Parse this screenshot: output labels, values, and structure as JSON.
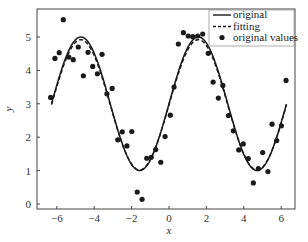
{
  "chart_data": {
    "type": "line",
    "title": "",
    "xlabel": "x",
    "ylabel": "y",
    "xlim": [
      -7.0,
      6.95
    ],
    "ylim": [
      -0.15,
      5.85
    ],
    "xticks": [
      -6,
      -4,
      -2,
      0,
      2,
      4,
      6
    ],
    "xtick_labels": [
      "−6",
      "−4",
      "−2",
      "0",
      "2",
      "4",
      "6"
    ],
    "yticks": [
      0,
      1,
      2,
      3,
      4,
      5
    ],
    "ytick_labels": [
      "0",
      "1",
      "2",
      "3",
      "4",
      "5"
    ],
    "grid": false,
    "legend_position": "upper right",
    "legend": [
      {
        "label": "original",
        "style": "solid-line"
      },
      {
        "label": "fitting",
        "style": "dashed-line"
      },
      {
        "label": "original values",
        "style": "dot-marker"
      }
    ],
    "series": [
      {
        "name": "original",
        "type": "line",
        "style": "solid",
        "color": "#1a1a1a",
        "function": "y = 3 + 2*sin(x)",
        "params": {
          "offset": 3.0,
          "amplitude": 2.0,
          "phase": 0.0
        },
        "x_range": [
          -6.28,
          6.28
        ]
      },
      {
        "name": "fitting",
        "type": "line",
        "style": "dashed",
        "color": "#1a1a1a",
        "function": "y = 2.97 + 1.95*sin(x)",
        "params": {
          "offset": 2.97,
          "amplitude": 1.95,
          "phase": 0.0
        },
        "x_range": [
          -6.28,
          6.28
        ]
      },
      {
        "name": "original values",
        "type": "scatter",
        "color": "#1a1a1a",
        "points": [
          [
            -6.33,
            3.19
          ],
          [
            -6.1,
            4.36
          ],
          [
            -5.87,
            4.53
          ],
          [
            -5.65,
            5.52
          ],
          [
            -5.36,
            4.4
          ],
          [
            -5.12,
            4.32
          ],
          [
            -4.85,
            4.7
          ],
          [
            -4.58,
            3.84
          ],
          [
            -4.33,
            4.54
          ],
          [
            -4.08,
            4.12
          ],
          [
            -3.83,
            3.9
          ],
          [
            -3.58,
            4.48
          ],
          [
            -3.32,
            3.3
          ],
          [
            -3.04,
            3.46
          ],
          [
            -2.74,
            1.92
          ],
          [
            -2.5,
            2.16
          ],
          [
            -2.25,
            1.74
          ],
          [
            -1.99,
            2.17
          ],
          [
            -1.7,
            0.36
          ],
          [
            -1.44,
            0.14
          ],
          [
            -1.19,
            1.37
          ],
          [
            -0.95,
            1.4
          ],
          [
            -0.71,
            1.63
          ],
          [
            -0.44,
            1.25
          ],
          [
            -0.21,
            2.02
          ],
          [
            0.07,
            2.66
          ],
          [
            0.27,
            3.5
          ],
          [
            0.5,
            4.79
          ],
          [
            0.77,
            5.13
          ],
          [
            1.03,
            5.03
          ],
          [
            1.27,
            5.01
          ],
          [
            1.53,
            5.03
          ],
          [
            1.8,
            5.09
          ],
          [
            2.1,
            4.51
          ],
          [
            2.36,
            3.65
          ],
          [
            2.64,
            3.17
          ],
          [
            2.88,
            3.55
          ],
          [
            3.18,
            2.65
          ],
          [
            3.44,
            2.19
          ],
          [
            3.73,
            1.62
          ],
          [
            3.97,
            1.8
          ],
          [
            4.24,
            1.36
          ],
          [
            4.51,
            0.63
          ],
          [
            4.78,
            1.06
          ],
          [
            5.01,
            1.54
          ],
          [
            5.29,
            0.97
          ],
          [
            5.51,
            2.39
          ],
          [
            5.76,
            1.9
          ],
          [
            6.01,
            2.34
          ],
          [
            6.26,
            3.7
          ]
        ]
      }
    ]
  },
  "layout": {
    "plot_left": 37,
    "plot_top": 9,
    "plot_right": 295,
    "plot_bottom": 209,
    "x_px_per_unit": 18.7,
    "x_zero_px": 169,
    "y_px_per_unit": 33.4,
    "y_zero_px": 204
  }
}
